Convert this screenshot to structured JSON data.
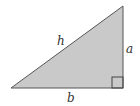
{
  "diagram": {
    "type": "right-triangle",
    "colors": {
      "fill": "#c9c9c9",
      "stroke": "#555555",
      "label": "#333333"
    },
    "labels": {
      "hypotenuse": "h",
      "vertical_leg": "a",
      "horizontal_leg": "b"
    },
    "right_angle_marker": "bottom-right"
  }
}
